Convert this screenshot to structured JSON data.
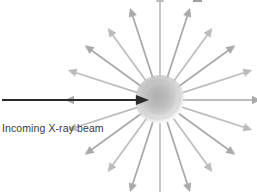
{
  "figure": {
    "kind": "scientific-diagram",
    "background_color": "#ffffff",
    "width": 257,
    "height": 192
  },
  "labels": {
    "incoming_beam": "Incoming X-ray beam"
  },
  "colors": {
    "scatter_arrow": "#a9a9a9",
    "scatter_arrow_light": "#bdbdbd",
    "incoming_beam": "#2b2b2b",
    "sphere_core": "#b4b4b4",
    "sphere_mid": "#c6c6c6",
    "sphere_edge": "#ffffff",
    "label_text": "#3a3a3a",
    "top_artifact": "#8f8f8f"
  },
  "scatterer": {
    "name": "atom-sphere",
    "center_x": 160,
    "center_y": 100,
    "radius": 19,
    "style": "soft radial gradient blob"
  },
  "incoming_beam": {
    "name": "incoming-x-ray-beam-arrow",
    "start_x": 2,
    "start_y": 100,
    "tip_x": 149,
    "tip_y": 100,
    "line_width": 2.2,
    "head_length": 13,
    "head_half_width": 5
  },
  "scattered_rays": {
    "count": 20,
    "inner_radius": 23,
    "line_width": 1.7,
    "head_length": 9,
    "head_half_width": 4.2,
    "angles_deg": [
      0,
      18,
      36,
      54,
      72,
      90,
      108,
      126,
      144,
      162,
      180,
      198,
      216,
      234,
      252,
      270,
      288,
      306,
      324,
      342
    ],
    "lengths": [
      78,
      74,
      70,
      66,
      74,
      84,
      74,
      66,
      70,
      74,
      72,
      74,
      70,
      66,
      74,
      84,
      74,
      66,
      70,
      74
    ]
  },
  "top_artifact": {
    "name": "clipped-text-artifact",
    "x": 193,
    "y": 0,
    "width": 9,
    "height": 2
  }
}
